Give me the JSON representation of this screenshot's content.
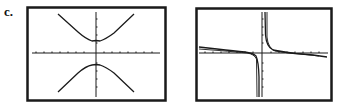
{
  "label": "c.",
  "graphs": [
    {
      "name": "hyperbola-graph",
      "description": "Two branches opening up and down, symmetric about y-axis",
      "frame": {
        "x": 26,
        "y": 6,
        "w": 140,
        "h": 95
      }
    },
    {
      "name": "rational-function-graph",
      "description": "Vertical asymptote near y-axis, horizontal asymptote near x-axis",
      "frame": {
        "x": 195,
        "y": 7,
        "w": 137,
        "h": 94
      }
    }
  ],
  "colors": {
    "stroke": "#1a1a1a",
    "background": "#ffffff"
  }
}
